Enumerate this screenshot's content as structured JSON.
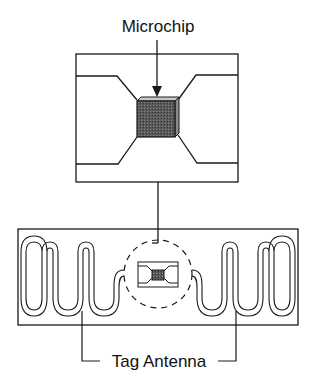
{
  "labels": {
    "microchip": "Microchip",
    "tag_antenna": "Tag Antenna"
  },
  "colors": {
    "line": "#1a1a1a",
    "chip_fill": "#555555",
    "chip_top": "#bdbdbd",
    "chip_side": "#8a8a8a",
    "background": "#ffffff"
  },
  "components": [
    {
      "name": "microchip",
      "description": "Enlarged detail of chip module"
    },
    {
      "name": "tag-antenna",
      "description": "Meander dipole antenna on tag inlay"
    }
  ]
}
